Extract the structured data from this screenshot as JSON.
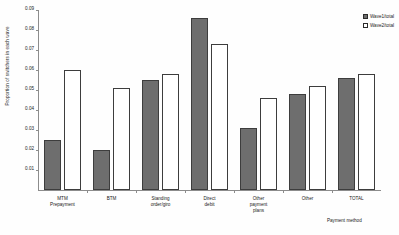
{
  "chart_data": {
    "type": "bar",
    "title": "",
    "xlabel": "Payment method",
    "ylabel": "Proportion of switchers in each wave",
    "ylim": [
      0,
      0.09
    ],
    "yticks": [
      "0.01",
      "0.02",
      "0.03",
      "0.04",
      "0.05",
      "0.06",
      "0.07",
      "0.08",
      "0.09"
    ],
    "ytick_values": [
      0.01,
      0.02,
      0.03,
      0.04,
      0.05,
      0.06,
      0.07,
      0.08,
      0.09
    ],
    "grid": false,
    "legend_position": "top-right",
    "categories": [
      "MTM\nPrepayment",
      "BTM",
      "Standing\norder/giro",
      "Direct\ndebit",
      "Other\npayment\nplans",
      "Other",
      "TOTAL"
    ],
    "category_labels": [
      {
        "line1": "MTM",
        "line2": "Prepayment",
        "line3": ""
      },
      {
        "line1": "BTM",
        "line2": "",
        "line3": ""
      },
      {
        "line1": "Standing",
        "line2": "order/giro",
        "line3": ""
      },
      {
        "line1": "Direct",
        "line2": "debit",
        "line3": ""
      },
      {
        "line1": "Other",
        "line2": "payment",
        "line3": "plans"
      },
      {
        "line1": "Other",
        "line2": "",
        "line3": ""
      },
      {
        "line1": "TOTAL",
        "line2": "",
        "line3": ""
      }
    ],
    "series": [
      {
        "name": "Wave1/total",
        "color": "#6e6e6e",
        "values": [
          0.025,
          0.02,
          0.055,
          0.086,
          0.031,
          0.048,
          0.056
        ]
      },
      {
        "name": "Wave2/total",
        "color": "#ffffff",
        "values": [
          0.06,
          0.051,
          0.058,
          0.073,
          0.046,
          0.052,
          0.058
        ]
      }
    ]
  },
  "legend": {
    "items": [
      {
        "label": "Wave1/total",
        "swatch": "filled-gray"
      },
      {
        "label": "Wave2/total",
        "swatch": "outline-white"
      }
    ]
  },
  "axes": {
    "y_title": "Proportion of switchers in each wave",
    "x_title": "Payment method"
  }
}
